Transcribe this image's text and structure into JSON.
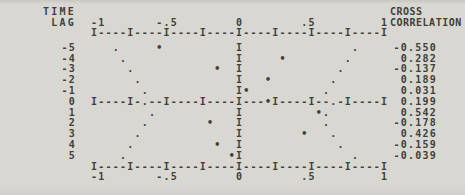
{
  "page": {
    "background_color": "#d8d7d2",
    "ink_color": "#403f39"
  },
  "header": {
    "left_line1": "TIME",
    "left_line2": "LAG",
    "right_line1": "CROSS",
    "right_line2": "CORRELATION"
  },
  "chart_data": {
    "type": "scatter",
    "subtype": "line-printer cross-correlation function plot",
    "xlabel": "correlation",
    "ylabel": "TIME LAG",
    "xlim": [
      -1,
      1
    ],
    "grid": false,
    "axis_chars": 41,
    "ruler_pattern": {
      "tick_char": "I",
      "dash_char": "-",
      "tick_every": 5
    },
    "center_char": "I",
    "marker_value": "•",
    "marker_dot": ".",
    "x_ticks": [
      {
        "label": "-1",
        "start": 0
      },
      {
        "label": "-.5",
        "start": 9
      },
      {
        "label": "0",
        "start": 20
      },
      {
        "label": ".5",
        "start": 29
      },
      {
        "label": "1",
        "start": 40
      }
    ],
    "lags": [
      -5,
      -4,
      -3,
      -2,
      -1,
      0,
      1,
      2,
      3,
      4,
      5
    ],
    "ccf": [
      -0.55,
      0.282,
      -0.137,
      0.189,
      0.031,
      0.199,
      0.542,
      -0.178,
      0.426,
      -0.159,
      -0.039
    ],
    "ccf_labels": [
      "-0.550",
      "0.282",
      "-0.137",
      "0.189",
      "0.031",
      "0.199",
      "0.542",
      "-0.178",
      "0.426",
      "-0.159",
      "-0.039"
    ],
    "dot_series_left": [
      -0.85,
      -0.8,
      -0.75,
      -0.7,
      -0.65,
      -0.65,
      -0.6,
      -0.65,
      -0.7,
      -0.75,
      -0.8
    ],
    "dot_series_right": [
      0.8,
      0.75,
      0.7,
      0.65,
      0.6,
      0.65,
      0.58,
      0.62,
      0.66,
      0.71,
      0.8
    ]
  }
}
